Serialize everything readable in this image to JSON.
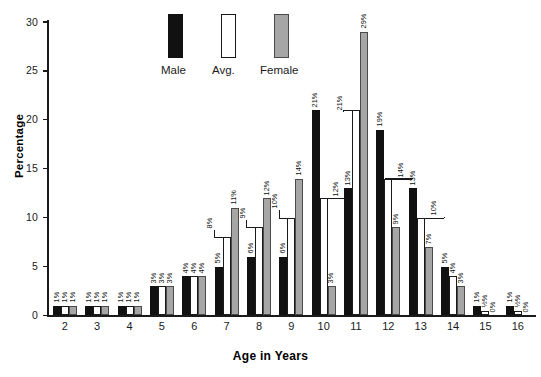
{
  "chart_data": {
    "type": "bar",
    "title": "",
    "subtitle": "",
    "xlabel": "Age in Years",
    "ylabel": "Percentage",
    "ylim": [
      0,
      31
    ],
    "yticks": [
      0,
      5,
      10,
      15,
      20,
      25,
      30
    ],
    "grid": false,
    "legend_position": "top-center",
    "categories": [
      "2",
      "3",
      "4",
      "5",
      "6",
      "7",
      "8",
      "9",
      "10",
      "11",
      "12",
      "13",
      "14",
      "15",
      "16"
    ],
    "series": [
      {
        "name": "Male",
        "color": "#111111",
        "values": [
          1,
          1,
          1,
          3,
          4,
          5,
          6,
          6,
          21,
          13,
          19,
          13,
          5,
          1,
          1
        ],
        "labels": [
          "1%",
          "1%",
          "1%",
          "3%",
          "4%",
          "5%",
          "6%",
          "6%",
          "21%",
          "13%",
          "19%",
          "13%",
          "5%",
          "1%",
          "1%"
        ]
      },
      {
        "name": "Avg.",
        "color": "#ffffff",
        "values": [
          1,
          1,
          1,
          3,
          4,
          8,
          9,
          10,
          12,
          21,
          14,
          10,
          4,
          0.5,
          0.5
        ],
        "labels": [
          "1%",
          "1%",
          "1%",
          "3%",
          "4%",
          "8%",
          "9%",
          "10%",
          "12%",
          "21%",
          "14%",
          "10%",
          "4%",
          "½%",
          "½%"
        ]
      },
      {
        "name": "Female",
        "color": "#a6a6a6",
        "values": [
          1,
          1,
          1,
          3,
          4,
          11,
          12,
          14,
          3,
          29,
          9,
          7,
          3,
          0,
          0
        ],
        "labels": [
          "1%",
          "1%",
          "1%",
          "3%",
          "4%",
          "11%",
          "12%",
          "14%",
          "3%",
          "29%",
          "9%",
          "7%",
          "3%",
          "0%",
          "0%"
        ]
      }
    ]
  },
  "legend": {
    "items": [
      {
        "label": "Male",
        "swatch": "filled-black-swatch"
      },
      {
        "label": "Avg.",
        "swatch": "outlined-white-swatch"
      },
      {
        "label": "Female",
        "swatch": "filled-gray-swatch"
      }
    ]
  },
  "colors": {
    "male": "#111111",
    "avg": "#ffffff",
    "avg_outline": "#1a1a1a",
    "female": "#a6a6a6",
    "female_outline": "#4a4a4a",
    "axis": "#1a1a1a",
    "background": "#ffffff"
  }
}
